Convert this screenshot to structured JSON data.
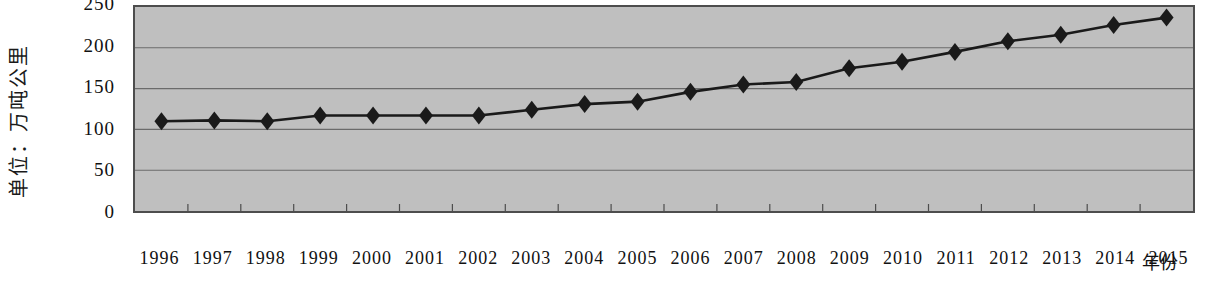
{
  "chart_data": {
    "type": "line",
    "title": "",
    "xlabel": "年份",
    "ylabel": "单位：万吨公里",
    "categories": [
      "1996",
      "1997",
      "1998",
      "1999",
      "2000",
      "2001",
      "2002",
      "2003",
      "2004",
      "2005",
      "2006",
      "2007",
      "2008",
      "2009",
      "2010",
      "2011",
      "2012",
      "2013",
      "2014",
      "2015"
    ],
    "values": [
      110,
      111,
      110,
      117,
      117,
      117,
      117,
      124,
      131,
      134,
      146,
      155,
      158,
      175,
      183,
      195,
      208,
      216,
      228,
      237
    ],
    "series": [
      {
        "name": "货物周转量",
        "values": [
          110,
          111,
          110,
          117,
          117,
          117,
          117,
          124,
          131,
          134,
          146,
          155,
          158,
          175,
          183,
          195,
          208,
          216,
          228,
          237
        ]
      }
    ],
    "ylim": [
      0,
      250
    ],
    "yticks": [
      0,
      50,
      100,
      150,
      200,
      250
    ],
    "ytick_labels": [
      "0",
      "50",
      "100",
      "150",
      "200",
      "250"
    ],
    "grid": true,
    "legend": "none",
    "marker": "diamond",
    "line_color": "#1a1a1a",
    "marker_color": "#1a1a1a",
    "plot_background": "#bfbfbf",
    "grid_color": "#6b6b6b",
    "axis_color": "#4d4d4d"
  }
}
